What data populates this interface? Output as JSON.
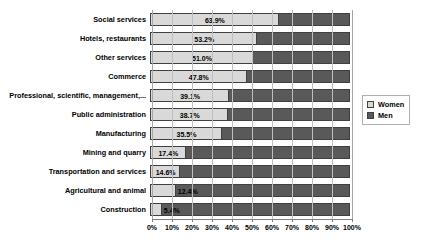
{
  "chart_data": {
    "type": "bar",
    "orientation": "horizontal",
    "stacked": true,
    "stacked_percent": true,
    "title": "",
    "subtitle": "",
    "xlabel": "",
    "ylabel": "",
    "xlim": [
      0,
      100
    ],
    "xticks": [
      0,
      10,
      20,
      30,
      40,
      50,
      60,
      70,
      80,
      90,
      100
    ],
    "xtick_labels": [
      "0%",
      "10%",
      "20%",
      "30%",
      "40%",
      "50%",
      "60%",
      "70%",
      "80%",
      "90%",
      "100%"
    ],
    "grid": true,
    "grid_axis": "x",
    "legend_position": "right",
    "categories": [
      "Social services",
      "Hotels, restaurants",
      "Other services",
      "Commerce",
      "Professional, scientific, management,...",
      "Public administration",
      "Manufacturing",
      "Mining and quarry",
      "Transportation and services",
      "Agricultural and animal",
      "Construction"
    ],
    "series": [
      {
        "name": "Women",
        "color": "#d9d9d9",
        "values": [
          63.9,
          53.2,
          51.0,
          47.8,
          39.1,
          38.7,
          35.5,
          17.4,
          14.6,
          12.4,
          5.4
        ],
        "labels": [
          "63.9%",
          "53.2%",
          "51.0%",
          "47.8%",
          "39.1%",
          "38.7%",
          "35.5%",
          "17.4%",
          "14.6%",
          "12.4%",
          "5.4%"
        ]
      },
      {
        "name": "Men",
        "color": "#595959",
        "values": [
          36.1,
          46.8,
          49.0,
          52.2,
          60.9,
          61.3,
          64.5,
          82.6,
          85.4,
          87.6,
          94.6
        ],
        "labels": [
          "",
          "",
          "",
          "",
          "",
          "",
          "",
          "",
          "",
          "",
          ""
        ]
      }
    ]
  },
  "legend": {
    "items": [
      {
        "label": "Women",
        "color": "#d9d9d9"
      },
      {
        "label": "Men",
        "color": "#595959"
      }
    ]
  },
  "axis": {
    "tick_labels": [
      "0%",
      "10%",
      "20%",
      "30%",
      "40%",
      "50%",
      "60%",
      "70%",
      "80%",
      "90%",
      "100%"
    ]
  },
  "rows": [
    {
      "category": "Social services",
      "women": 63.9,
      "women_label": "63.9%"
    },
    {
      "category": "Hotels, restaurants",
      "women": 53.2,
      "women_label": "53.2%"
    },
    {
      "category": "Other services",
      "women": 51.0,
      "women_label": "51.0%"
    },
    {
      "category": "Commerce",
      "women": 47.8,
      "women_label": "47.8%"
    },
    {
      "category": "Professional, scientific, management,...",
      "women": 39.1,
      "women_label": "39.1%"
    },
    {
      "category": "Public administration",
      "women": 38.7,
      "women_label": "38.7%"
    },
    {
      "category": "Manufacturing",
      "women": 35.5,
      "women_label": "35.5%"
    },
    {
      "category": "Mining and quarry",
      "women": 17.4,
      "women_label": "17.4%"
    },
    {
      "category": "Transportation and services",
      "women": 14.6,
      "women_label": "14.6%"
    },
    {
      "category": "Agricultural and animal",
      "women": 12.4,
      "women_label": "12.4%"
    },
    {
      "category": "Construction",
      "women": 5.4,
      "women_label": "5.4%"
    }
  ]
}
